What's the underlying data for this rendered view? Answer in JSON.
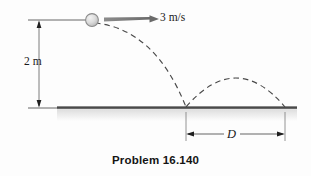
{
  "figure": {
    "caption": "Problem 16.140",
    "labels": {
      "height": "2 m",
      "speed": "3 m/s",
      "distance": "D"
    },
    "colors": {
      "ink": "#1a1a1a",
      "ground": "#6f6f6f",
      "ground_dark": "#3d3d3d",
      "dash": "#4a4a4a",
      "arrow": "#707070",
      "ball_fill": "#d8d8d8",
      "ball_edge": "#8a8a8a",
      "background": "#fdfdfd",
      "shadow": "#e8e8e8"
    },
    "elements": [
      {
        "name": "ball",
        "kind": "circle",
        "cx": 92,
        "cy": 20,
        "r": 6.5
      },
      {
        "name": "velocity-arrow",
        "kind": "wedge-arrow",
        "from_x": 104,
        "to_x": 158,
        "y": 19,
        "label": "3 m/s"
      },
      {
        "name": "height-dimension",
        "kind": "vertical-dimension",
        "x": 39,
        "top_y": 20,
        "bottom_y": 108,
        "label": "2 m"
      },
      {
        "name": "ground-line",
        "kind": "line",
        "x1": 57,
        "y1": 108,
        "x2": 297,
        "y2": 108
      },
      {
        "name": "fall-trajectory",
        "kind": "dashed-parabola",
        "start_x": 95,
        "start_y": 24,
        "end_x": 186,
        "end_y": 107
      },
      {
        "name": "bounce-trajectory",
        "kind": "dashed-parabola",
        "start_x": 186,
        "start_y": 107,
        "apex_x": 236,
        "apex_y": 78,
        "end_x": 285,
        "end_y": 107
      },
      {
        "name": "distance-dimension",
        "kind": "horizontal-dimension",
        "y": 134,
        "left_x": 186,
        "right_x": 285,
        "label": "D"
      }
    ]
  }
}
